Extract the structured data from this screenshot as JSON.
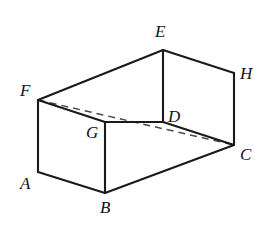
{
  "figure": {
    "type": "3d-solid-diagram",
    "shape": "rectangular prism (cuboid)",
    "background_color": "#ffffff",
    "edge_color": "#1a1a1a",
    "hidden_edge_color": "#4a4a4a",
    "label_color": "#111111"
  },
  "vertices": [
    {
      "name": "A",
      "label": "A",
      "x": 38,
      "y": 172,
      "label_x": 20,
      "label_y": 175,
      "hidden": false
    },
    {
      "name": "B",
      "label": "B",
      "x": 105,
      "y": 193,
      "label_x": 100,
      "label_y": 199,
      "hidden": false
    },
    {
      "name": "C",
      "label": "C",
      "x": 234,
      "y": 145,
      "label_x": 240,
      "label_y": 146,
      "hidden": false
    },
    {
      "name": "D",
      "label": "D",
      "x": 163,
      "y": 122,
      "label_x": 168,
      "label_y": 108,
      "hidden": false
    },
    {
      "name": "E",
      "label": "E",
      "x": 163,
      "y": 50,
      "label_x": 155,
      "label_y": 23,
      "hidden": false
    },
    {
      "name": "F",
      "label": "F",
      "x": 38,
      "y": 100,
      "label_x": 20,
      "label_y": 82,
      "hidden": false
    },
    {
      "name": "G",
      "label": "G",
      "x": 105,
      "y": 122,
      "label_x": 86,
      "label_y": 124,
      "hidden": false
    },
    {
      "name": "H",
      "label": "H",
      "x": 234,
      "y": 73,
      "label_x": 240,
      "label_y": 65,
      "hidden": false
    }
  ],
  "edges": [
    {
      "from": "F",
      "to": "E",
      "style": "solid",
      "name": "edge-FE"
    },
    {
      "from": "E",
      "to": "H",
      "style": "solid",
      "name": "edge-EH"
    },
    {
      "from": "F",
      "to": "G",
      "style": "solid",
      "name": "edge-FG"
    },
    {
      "from": "G",
      "to": "D",
      "style": "solid",
      "name": "edge-GD"
    },
    {
      "from": "D",
      "to": "C",
      "style": "solid",
      "name": "edge-DC"
    },
    {
      "from": "E",
      "to": "D",
      "style": "solid",
      "name": "edge-ED"
    },
    {
      "from": "H",
      "to": "C",
      "style": "solid",
      "name": "edge-HC"
    },
    {
      "from": "F",
      "to": "A",
      "style": "solid",
      "name": "edge-FA"
    },
    {
      "from": "G",
      "to": "B",
      "style": "solid",
      "name": "edge-GB"
    },
    {
      "from": "A",
      "to": "B",
      "style": "solid",
      "name": "edge-AB"
    },
    {
      "from": "B",
      "to": "C",
      "style": "solid",
      "name": "edge-BC"
    },
    {
      "from": "F",
      "to": "C",
      "style": "dashed",
      "name": "hidden-diagonal-FC"
    }
  ],
  "label_list": [
    "A",
    "B",
    "C",
    "D",
    "E",
    "F",
    "G",
    "H"
  ]
}
